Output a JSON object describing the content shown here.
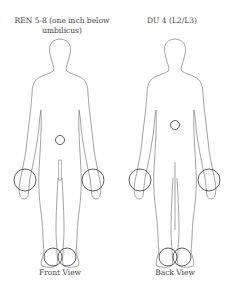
{
  "figures": [
    {
      "id": "front",
      "title": "REN 5-8 (one inch below umbilicus)",
      "caption": "Front View",
      "markers": [
        "navel-circle",
        "left-wrist-circle",
        "right-wrist-circle",
        "left-ankle-circle",
        "right-ankle-circle"
      ]
    },
    {
      "id": "back",
      "title": "DU 4 (L2/L3)",
      "caption": "Back View",
      "markers": [
        "lumbar-circle",
        "left-wrist-circle",
        "right-wrist-circle",
        "left-ankle-circle",
        "right-ankle-circle"
      ]
    }
  ],
  "colors": {
    "outline": "#555555",
    "marker": "#333333",
    "background": "#ffffff"
  }
}
